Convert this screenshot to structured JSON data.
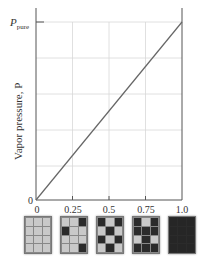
{
  "chart_data": {
    "type": "line",
    "title": "",
    "xlabel": "",
    "ylabel": "Vapor pressure, P",
    "x_ticks": [
      "0",
      "0.25",
      "0.5",
      "0.75",
      "1.0"
    ],
    "y_ticks": [
      "0",
      "P_pure"
    ],
    "xlim": [
      0,
      1
    ],
    "ylim": [
      0,
      1
    ],
    "grid": true,
    "series": [
      {
        "name": "Vapor pressure",
        "x": [
          0,
          0.25,
          0.5,
          0.75,
          1.0
        ],
        "y": [
          0,
          0.25,
          0.5,
          0.75,
          1.0
        ]
      }
    ],
    "annotations": [
      "P_pure marks vapor pressure of pure solvent at x = 1.0"
    ]
  },
  "labels": {
    "ylabel": "Vapor pressure, P",
    "y_top_main": "P",
    "y_top_sub": "pure",
    "y_zero": "0",
    "x_ticks": [
      "0",
      "0.25",
      "0.5",
      "0.75",
      "1.0"
    ]
  },
  "tiles": [
    {
      "fraction": "0",
      "pattern": [
        [
          0,
          0,
          0
        ],
        [
          0,
          0,
          0
        ],
        [
          0,
          0,
          0
        ],
        [
          0,
          0,
          0
        ]
      ]
    },
    {
      "fraction": "0.25",
      "pattern": [
        [
          0,
          0,
          1
        ],
        [
          1,
          0,
          0
        ],
        [
          0,
          0,
          0
        ],
        [
          0,
          0,
          1
        ]
      ]
    },
    {
      "fraction": "0.5",
      "pattern": [
        [
          1,
          0,
          1
        ],
        [
          0,
          1,
          0
        ],
        [
          1,
          0,
          1
        ],
        [
          0,
          1,
          0
        ]
      ]
    },
    {
      "fraction": "0.75",
      "pattern": [
        [
          1,
          0,
          1
        ],
        [
          1,
          1,
          1
        ],
        [
          0,
          1,
          0
        ],
        [
          1,
          1,
          1
        ]
      ]
    },
    {
      "fraction": "1.0",
      "pattern": [
        [
          1,
          1,
          1
        ],
        [
          1,
          1,
          1
        ],
        [
          1,
          1,
          1
        ],
        [
          1,
          1,
          1
        ]
      ]
    }
  ],
  "colors": {
    "axis": "#555555",
    "grid": "#d8d8d8",
    "line": "#666666",
    "cell_light": "#c9c9c9",
    "cell_dark": "#2b2b2b"
  }
}
